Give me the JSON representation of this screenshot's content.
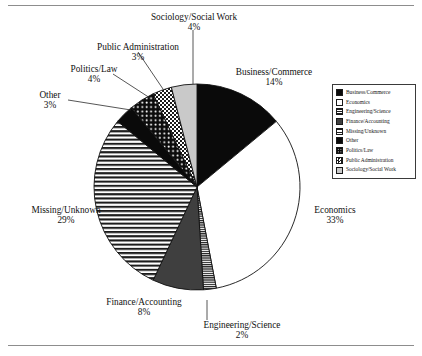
{
  "figure": {
    "has_top_rule": true,
    "has_bottom_rule": true,
    "background": "#ffffff",
    "ink": "#111111"
  },
  "chart_data": {
    "type": "pie",
    "title": "",
    "xlabel": "",
    "ylabel": "",
    "units": "percent",
    "start_angle_deg": 0,
    "direction": "clockwise",
    "center": {
      "x": 197,
      "y": 187
    },
    "radius": 103,
    "legend_position": "right",
    "grid": false,
    "categories": [
      "Business/Commerce",
      "Economics",
      "Engineering/Science",
      "Finance/Accounting",
      "Missing/Unknown",
      "Other",
      "Politics/Law",
      "Public Administration",
      "Sociology/Social Work"
    ],
    "values": [
      14,
      33,
      2,
      8,
      29,
      3,
      4,
      3,
      4
    ],
    "slices": [
      {
        "label": "Business/Commerce",
        "value": 14,
        "pct_text": "14%",
        "fill": "#0a0a0a",
        "pattern": "solid-black"
      },
      {
        "label": "Economics",
        "value": 33,
        "pct_text": "33%",
        "fill": "#ffffff",
        "pattern": "solid-white"
      },
      {
        "label": "Engineering/Science",
        "value": 2,
        "pct_text": "2%",
        "fill": "#3a3a3a",
        "pattern": "fine-horizontal-lines"
      },
      {
        "label": "Finance/Accounting",
        "value": 8,
        "pct_text": "8%",
        "fill": "#3f3f3f",
        "pattern": "solid-dark-gray"
      },
      {
        "label": "Missing/Unknown",
        "value": 29,
        "pct_text": "29%",
        "fill": "#e8e8e8",
        "pattern": "horizontal-stripes"
      },
      {
        "label": "Other",
        "value": 3,
        "pct_text": "3%",
        "fill": "#0a0a0a",
        "pattern": "solid-black"
      },
      {
        "label": "Politics/Law",
        "value": 4,
        "pct_text": "4%",
        "fill": "#141414",
        "pattern": "dark-with-dots"
      },
      {
        "label": "Public Administration",
        "value": 3,
        "pct_text": "3%",
        "fill": "#ffffff",
        "pattern": "checkerboard"
      },
      {
        "label": "Sociology/Social Work",
        "value": 4,
        "pct_text": "4%",
        "fill": "#c9c9c9",
        "pattern": "light-gray"
      }
    ]
  },
  "callouts": [
    {
      "name": "sociology-social-work",
      "label": "Sociology/Social Work",
      "pct": "4%"
    },
    {
      "name": "public-administration",
      "label": "Public Administration",
      "pct": "3%"
    },
    {
      "name": "politics-law",
      "label": "Politics/Law",
      "pct": "4%"
    },
    {
      "name": "other",
      "label": "Other",
      "pct": "3%"
    },
    {
      "name": "business-commerce",
      "label": "Business/Commerce",
      "pct": "14%"
    },
    {
      "name": "economics",
      "label": "Economics",
      "pct": "33%"
    },
    {
      "name": "engineering-science",
      "label": "Engineering/Science",
      "pct": "2%"
    },
    {
      "name": "finance-accounting",
      "label": "Finance/Accounting",
      "pct": "8%"
    },
    {
      "name": "missing-unknown",
      "label": "Missing/Unknown",
      "pct": "29%"
    }
  ],
  "legend": {
    "items": [
      {
        "label": "Business/Commerce",
        "pattern": "solid-black"
      },
      {
        "label": "Economics",
        "pattern": "solid-white"
      },
      {
        "label": "Engineering/Science",
        "pattern": "fine-horizontal-lines"
      },
      {
        "label": "Finance/Accounting",
        "pattern": "solid-dark-gray"
      },
      {
        "label": "Missing/Unknown",
        "pattern": "horizontal-stripes"
      },
      {
        "label": "Other",
        "pattern": "solid-black"
      },
      {
        "label": "Politics/Law",
        "pattern": "dark-with-dots"
      },
      {
        "label": "Public Administration",
        "pattern": "checkerboard"
      },
      {
        "label": "Sociology/Social Work",
        "pattern": "light-gray"
      }
    ]
  }
}
